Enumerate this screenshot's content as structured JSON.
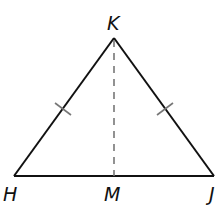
{
  "diagram": {
    "type": "isosceles-triangle",
    "vertices": {
      "K": {
        "label": "K",
        "x": 114,
        "y": 38
      },
      "H": {
        "label": "H",
        "x": 14,
        "y": 176
      },
      "J": {
        "label": "J",
        "x": 214,
        "y": 176
      },
      "M": {
        "label": "M",
        "x": 114,
        "y": 176
      }
    },
    "segments": [
      {
        "from": "H",
        "to": "K",
        "style": "solid",
        "tick_marks": 1
      },
      {
        "from": "K",
        "to": "J",
        "style": "solid",
        "tick_marks": 1
      },
      {
        "from": "H",
        "to": "J",
        "style": "solid",
        "tick_marks": 0
      },
      {
        "from": "K",
        "to": "M",
        "style": "dashed",
        "tick_marks": 0
      }
    ],
    "colors": {
      "line": "#111111",
      "dashed": "#777777",
      "tick": "#777777"
    }
  }
}
